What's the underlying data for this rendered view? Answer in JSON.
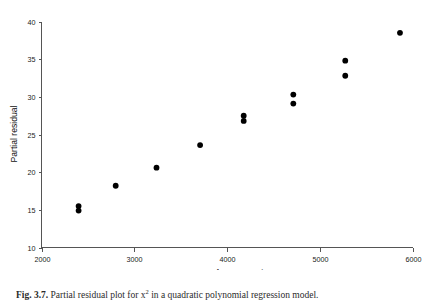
{
  "chart_data": {
    "type": "scatter",
    "title": "",
    "xlabel": "Square of concentration",
    "ylabel": "Partial residual",
    "xlim": [
      2000,
      6000
    ],
    "ylim": [
      10,
      40
    ],
    "xticks": [
      2000,
      3000,
      4000,
      5000,
      6000
    ],
    "yticks": [
      10,
      15,
      20,
      25,
      30,
      35,
      40
    ],
    "xtick_labels": [
      "2000",
      "3000",
      "4000",
      "5000",
      "6000"
    ],
    "ytick_labels": [
      "10",
      "15",
      "20",
      "25",
      "30",
      "35",
      "40"
    ],
    "grid": false,
    "legend": null,
    "marker": "filled-circle",
    "marker_color": "#000000",
    "points": [
      {
        "x": 2400,
        "y": 15.5
      },
      {
        "x": 2400,
        "y": 14.9
      },
      {
        "x": 2800,
        "y": 18.2
      },
      {
        "x": 3240,
        "y": 20.6
      },
      {
        "x": 3710,
        "y": 23.6
      },
      {
        "x": 4180,
        "y": 27.5
      },
      {
        "x": 4180,
        "y": 26.8
      },
      {
        "x": 4715,
        "y": 30.3
      },
      {
        "x": 4715,
        "y": 29.1
      },
      {
        "x": 5275,
        "y": 34.8
      },
      {
        "x": 5275,
        "y": 32.8
      },
      {
        "x": 5865,
        "y": 38.5
      }
    ]
  },
  "caption": {
    "label": "Fig. 3.7.",
    "text": "Partial residual plot for x"
  }
}
